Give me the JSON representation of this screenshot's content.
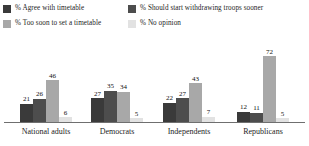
{
  "legend": {
    "items": [
      {
        "label": "% Agree with timetable",
        "color": "#3a3a3a",
        "column": "a",
        "row": 1
      },
      {
        "label": "% Should start withdrawing troops sooner",
        "color": "#4d4d4d",
        "column": "b",
        "row": 1
      },
      {
        "label": "% Too soon to set a timetable",
        "color": "#a8a8a8",
        "column": "a",
        "row": 2
      },
      {
        "label": "% No opinion",
        "color": "#e2e2e2",
        "column": "b",
        "row": 2
      }
    ]
  },
  "chart_data": {
    "type": "bar",
    "title": "",
    "subtitle": "",
    "xlabel": "",
    "ylabel": "",
    "ylim": [
      0,
      80
    ],
    "grid": false,
    "legend_position": "top",
    "value_labels": true,
    "categories": [
      "National adults",
      "Democrats",
      "Independents",
      "Republicans"
    ],
    "series": [
      {
        "name": "% Agree with timetable",
        "color": "#3a3a3a",
        "values": [
          21,
          27,
          22,
          12
        ]
      },
      {
        "name": "% Should start withdrawing troops sooner",
        "color": "#4d4d4d",
        "values": [
          26,
          35,
          27,
          11
        ]
      },
      {
        "name": "% Too soon to set a timetable",
        "color": "#a8a8a8",
        "values": [
          46,
          34,
          43,
          72
        ]
      },
      {
        "name": "% No opinion",
        "color": "#e2e2e2",
        "values": [
          6,
          5,
          7,
          5
        ]
      }
    ]
  },
  "axis": {
    "baseline_color": "#6f6f6f"
  }
}
